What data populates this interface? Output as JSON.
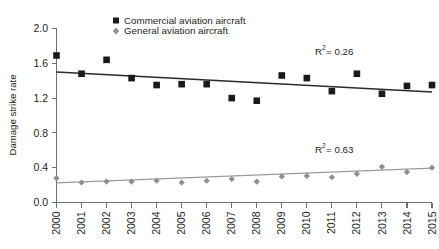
{
  "chart_data": {
    "type": "scatter",
    "title": "",
    "subtitle": "",
    "xlabel": "",
    "ylabel": "Damage strike rate",
    "x": [
      2000,
      2001,
      2002,
      2003,
      2004,
      2005,
      2006,
      2007,
      2008,
      2009,
      2010,
      2011,
      2012,
      2013,
      2014,
      2015
    ],
    "categories": [
      "2000",
      "2001",
      "2002",
      "2003",
      "2004",
      "2005",
      "2006",
      "2007",
      "2008",
      "2009",
      "2010",
      "2011",
      "2012",
      "2013",
      "2014",
      "2015"
    ],
    "xlim": [
      2000,
      2015
    ],
    "ylim": [
      0.0,
      2.0
    ],
    "yticks": [
      "0.0",
      "0.4",
      "0.8",
      "1.2",
      "1.6",
      "2.0"
    ],
    "ytick_values": [
      0.0,
      0.4,
      0.8,
      1.2,
      1.6,
      2.0
    ],
    "grid": false,
    "legend_position": "top-center",
    "series": [
      {
        "name": "Commercial aviation aircraft",
        "marker": "square",
        "color": "#1a1a1a",
        "values": [
          1.69,
          1.48,
          1.64,
          1.43,
          1.35,
          1.36,
          1.36,
          1.2,
          1.17,
          1.46,
          1.43,
          1.28,
          1.48,
          1.25,
          1.34,
          1.35
        ],
        "trendline": {
          "x_start": 2000,
          "y_start": 1.5,
          "x_end": 2015,
          "y_end": 1.27,
          "color": "#2b2b2b",
          "r_squared": "0.26"
        }
      },
      {
        "name": "General aviation aircraft",
        "marker": "diamond",
        "color": "#8e8e8e",
        "values": [
          0.28,
          0.23,
          0.24,
          0.24,
          0.25,
          0.23,
          0.25,
          0.27,
          0.24,
          0.3,
          0.305,
          0.29,
          0.33,
          0.41,
          0.35,
          0.4
        ],
        "trendline": {
          "x_start": 2000,
          "y_start": 0.225,
          "x_end": 2015,
          "y_end": 0.395,
          "color": "#9a9a9a",
          "r_squared": "0.63"
        }
      }
    ],
    "annotations": [
      {
        "label_prefix": "R",
        "label_sup": "2",
        "label_suffix": " = 0.26",
        "text": "R² = 0.26",
        "x": 2013.0,
        "y": 1.72
      },
      {
        "label_prefix": "R",
        "label_sup": "2",
        "label_suffix": " = 0.63",
        "text": "R² = 0.63",
        "x": 2013.0,
        "y": 0.6
      }
    ]
  },
  "legend": {
    "items": [
      {
        "label": "Commercial aviation aircraft",
        "marker": "square",
        "color": "#1a1a1a"
      },
      {
        "label": "General aviation aircraft",
        "marker": "diamond",
        "color": "#8e8e8e"
      }
    ]
  },
  "axes": {
    "y_title": "Damage strike rate"
  }
}
